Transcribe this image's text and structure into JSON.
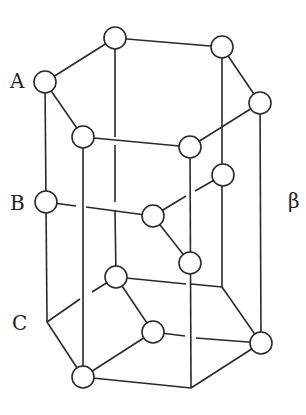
{
  "figure": {
    "layer_labels": [
      {
        "text": "A",
        "x": 10,
        "y": 88
      },
      {
        "text": "B",
        "x": 10,
        "y": 210
      },
      {
        "text": "C",
        "x": 12,
        "y": 330
      }
    ],
    "phase_label": {
      "text": "β",
      "x": 288,
      "y": 208
    },
    "atom_radius": 11,
    "atoms": [
      {
        "id": "A-top-back",
        "x": 115,
        "y": 38
      },
      {
        "id": "A-top-right-back",
        "x": 222,
        "y": 47
      },
      {
        "id": "A-left",
        "x": 45,
        "y": 82
      },
      {
        "id": "A-right",
        "x": 260,
        "y": 103
      },
      {
        "id": "A-front-left",
        "x": 83,
        "y": 137
      },
      {
        "id": "A-front-right",
        "x": 190,
        "y": 147
      },
      {
        "id": "B-left",
        "x": 46,
        "y": 202
      },
      {
        "id": "B-inner-right",
        "x": 223,
        "y": 175
      },
      {
        "id": "B-center",
        "x": 153,
        "y": 216
      },
      {
        "id": "B-inner-front",
        "x": 190,
        "y": 263
      },
      {
        "id": "C-inner-back",
        "x": 116,
        "y": 277
      },
      {
        "id": "C-inner-mid",
        "x": 153,
        "y": 332
      },
      {
        "id": "C-right",
        "x": 261,
        "y": 343
      },
      {
        "id": "C-front-left",
        "x": 83,
        "y": 377
      }
    ],
    "bonds": [
      {
        "x1": 45,
        "y1": 82,
        "x2": 115,
        "y2": 38
      },
      {
        "x1": 115,
        "y1": 38,
        "x2": 222,
        "y2": 47
      },
      {
        "x1": 222,
        "y1": 47,
        "x2": 260,
        "y2": 103
      },
      {
        "x1": 260,
        "y1": 103,
        "x2": 190,
        "y2": 147
      },
      {
        "x1": 190,
        "y1": 147,
        "x2": 83,
        "y2": 137
      },
      {
        "x1": 83,
        "y1": 137,
        "x2": 45,
        "y2": 82
      },
      {
        "x1": 45,
        "y1": 82,
        "x2": 47,
        "y2": 322
      },
      {
        "x1": 83,
        "y1": 137,
        "x2": 83,
        "y2": 377
      },
      {
        "x1": 190,
        "y1": 147,
        "x2": 191,
        "y2": 388
      },
      {
        "x1": 260,
        "y1": 103,
        "x2": 261,
        "y2": 343
      },
      {
        "x1": 222,
        "y1": 47,
        "x2": 222,
        "y2": 287
      },
      {
        "x1": 115,
        "y1": 38,
        "x2": 115,
        "y2": 137
      },
      {
        "x1": 115,
        "y1": 145,
        "x2": 115,
        "y2": 202
      },
      {
        "x1": 115,
        "y1": 210,
        "x2": 116,
        "y2": 277
      },
      {
        "x1": 47,
        "y1": 322,
        "x2": 83,
        "y2": 377
      },
      {
        "x1": 83,
        "y1": 377,
        "x2": 191,
        "y2": 388
      },
      {
        "x1": 191,
        "y1": 388,
        "x2": 261,
        "y2": 343
      },
      {
        "x1": 261,
        "y1": 343,
        "x2": 222,
        "y2": 287
      },
      {
        "x1": 222,
        "y1": 287,
        "x2": 191,
        "y2": 284
      },
      {
        "x1": 186,
        "y1": 284,
        "x2": 116,
        "y2": 277
      },
      {
        "x1": 116,
        "y1": 277,
        "x2": 92,
        "y2": 292
      },
      {
        "x1": 80,
        "y1": 299,
        "x2": 47,
        "y2": 322
      },
      {
        "x1": 46,
        "y1": 202,
        "x2": 76,
        "y2": 206
      },
      {
        "x1": 86,
        "y1": 207,
        "x2": 153,
        "y2": 216
      },
      {
        "x1": 153,
        "y1": 216,
        "x2": 186,
        "y2": 196
      },
      {
        "x1": 195,
        "y1": 191,
        "x2": 223,
        "y2": 175
      },
      {
        "x1": 153,
        "y1": 216,
        "x2": 190,
        "y2": 263
      },
      {
        "x1": 116,
        "y1": 277,
        "x2": 153,
        "y2": 332
      },
      {
        "x1": 153,
        "y1": 332,
        "x2": 83,
        "y2": 377
      },
      {
        "x1": 153,
        "y1": 332,
        "x2": 185,
        "y2": 336
      },
      {
        "x1": 196,
        "y1": 338,
        "x2": 261,
        "y2": 343
      }
    ]
  }
}
